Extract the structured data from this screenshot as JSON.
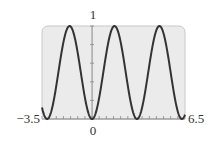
{
  "chart_data": {
    "type": "line",
    "title": "",
    "xlabel": "",
    "ylabel": "",
    "function": "y = sin^2(x)",
    "xlim": [
      -3.5,
      6.5
    ],
    "ylim": [
      0,
      1
    ],
    "x_tick_labels": {
      "left": "−3.5",
      "origin": "0",
      "right": "6.5"
    },
    "y_tick_labels": {
      "top": "1"
    },
    "x_minor_tick_step": 0.5,
    "y_minor_tick_step": 0.2,
    "grid": false,
    "legend": null,
    "series": [
      {
        "name": "sin^2(x)",
        "x": [
          -3.5,
          -3.14,
          -2.36,
          -1.57,
          -0.79,
          0,
          0.79,
          1.57,
          2.36,
          3.14,
          3.93,
          4.71,
          5.5,
          6.28,
          6.5
        ],
        "values": [
          0.12,
          0,
          0.5,
          1,
          0.5,
          0,
          0.5,
          1,
          0.5,
          0,
          0.5,
          1,
          0.5,
          0,
          0.05
        ]
      }
    ]
  },
  "style": {
    "plot_bg": "#ebebeb",
    "frame_color": "#c8c8c8",
    "curve_color": "#333333",
    "axis_color": "#888888"
  }
}
